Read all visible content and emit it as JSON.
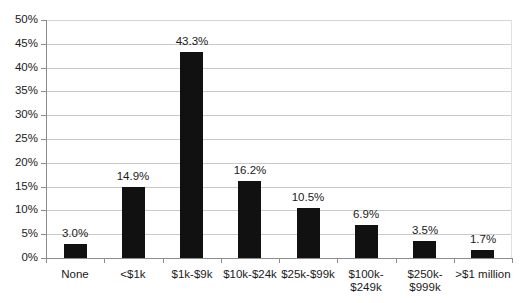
{
  "chart_data": {
    "type": "bar",
    "title": "",
    "subtitle": "",
    "xlabel": "",
    "ylabel": "",
    "ylim": [
      0,
      50
    ],
    "ytick_labels": [
      "50%",
      "45%",
      "40%",
      "35%",
      "30%",
      "25%",
      "20%",
      "15%",
      "10%",
      "5%",
      "0%"
    ],
    "ytick_values": [
      50,
      45,
      40,
      35,
      30,
      25,
      20,
      15,
      10,
      5,
      0
    ],
    "grid": true,
    "grid_axis": "y",
    "legend": false,
    "legend_position": "none",
    "bar_color": "#111111",
    "grid_color": "#c9c9c9",
    "axis_color": "#8c8c8c",
    "categories": [
      "None",
      "<$1k",
      "$1k-$9k",
      "$10k-$24k",
      "$25k-$99k",
      "$100k-$249k",
      "$250k-$999k",
      ">$1 million"
    ],
    "category_label_lines": [
      [
        "None"
      ],
      [
        "<$1k"
      ],
      [
        "$1k-$9k"
      ],
      [
        "$10k-$24k"
      ],
      [
        "$25k-$99k"
      ],
      [
        "$100k-",
        "$249k"
      ],
      [
        "$250k-",
        "$999k"
      ],
      [
        ">$1 million"
      ]
    ],
    "values": [
      3.0,
      14.9,
      43.3,
      16.2,
      10.5,
      6.9,
      3.5,
      1.7
    ],
    "data_labels": [
      "3.0%",
      "14.9%",
      "43.3%",
      "16.2%",
      "10.5%",
      "6.9%",
      "3.5%",
      "1.7%"
    ]
  }
}
